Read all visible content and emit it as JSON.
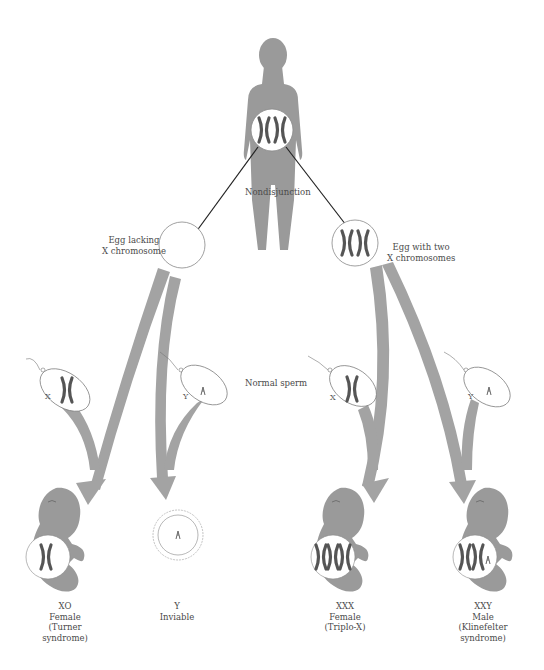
{
  "diagram": {
    "colors": {
      "figure": "#9a9a9a",
      "arrow": "#a3a3a3",
      "chromosome": "#555555",
      "line": "#222222",
      "outline": "#888888"
    },
    "mother": {
      "label": "Nondisjunction"
    },
    "eggs": [
      {
        "id": "egg-lacking",
        "line1": "Egg lacking",
        "line2": "X chromosome"
      },
      {
        "id": "egg-two-x",
        "line1": "Egg with two",
        "line2": "X chromosomes"
      }
    ],
    "sperm_label": "Normal sperm",
    "sperm": [
      {
        "id": "sperm-x-left",
        "label": "X"
      },
      {
        "id": "sperm-y-left",
        "label": "Y"
      },
      {
        "id": "sperm-x-right",
        "label": "X"
      },
      {
        "id": "sperm-y-right",
        "label": "Y"
      }
    ],
    "outcomes": [
      {
        "id": "xo",
        "karyotype": "XO",
        "sex": "Female",
        "note1": "(Turner",
        "note2": "syndrome)"
      },
      {
        "id": "y",
        "karyotype": "Y",
        "sex": "Inviable",
        "note1": "",
        "note2": ""
      },
      {
        "id": "xxx",
        "karyotype": "XXX",
        "sex": "Female",
        "note1": "(Triplo-X)",
        "note2": ""
      },
      {
        "id": "xxy",
        "karyotype": "XXY",
        "sex": "Male",
        "note1": "(Klinefelter",
        "note2": "syndrome)"
      }
    ]
  }
}
